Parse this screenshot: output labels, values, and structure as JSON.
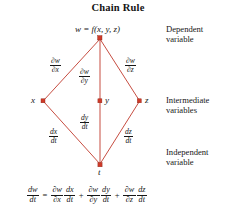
{
  "title": "Chain Rule",
  "colors": {
    "edge": "#c0392b",
    "node": "#cf3a28",
    "text": "#171717",
    "background": "#ffffff"
  },
  "diagram": {
    "type": "tree-diagram",
    "nodes": [
      {
        "id": "w",
        "label": "w = f(x, y, z)",
        "x": 100,
        "y": 38,
        "role": "dependent"
      },
      {
        "id": "x",
        "label": "x",
        "x": 43,
        "y": 101,
        "role": "intermediate"
      },
      {
        "id": "y",
        "label": "y",
        "x": 100,
        "y": 101,
        "role": "intermediate"
      },
      {
        "id": "z",
        "label": "z",
        "x": 140,
        "y": 101,
        "role": "intermediate"
      },
      {
        "id": "t",
        "label": "t",
        "x": 100,
        "y": 165,
        "role": "independent"
      }
    ],
    "edges": [
      {
        "from": "w",
        "to": "x",
        "num": "∂w",
        "den": "∂x"
      },
      {
        "from": "w",
        "to": "y",
        "num": "∂w",
        "den": "∂y"
      },
      {
        "from": "w",
        "to": "z",
        "num": "∂w",
        "den": "∂z"
      },
      {
        "from": "x",
        "to": "t",
        "num": "dx",
        "den": "dt"
      },
      {
        "from": "y",
        "to": "t",
        "num": "dy",
        "den": "dt"
      },
      {
        "from": "z",
        "to": "t",
        "num": "dz",
        "den": "dt"
      }
    ]
  },
  "annotations": {
    "dependent_line1": "Dependent",
    "dependent_line2": "variable",
    "intermediate_line1": "Intermediate",
    "intermediate_line2": "variables",
    "independent_line1": "Independent",
    "independent_line2": "variable"
  },
  "equation": {
    "lhs": {
      "num": "dw",
      "den": "dt"
    },
    "equals": "=",
    "plus": "+",
    "terms": [
      {
        "a_num": "∂w",
        "a_den": "∂x",
        "b_num": "dx",
        "b_den": "dt"
      },
      {
        "a_num": "∂w",
        "a_den": "∂y",
        "b_num": "dy",
        "b_den": "dt"
      },
      {
        "a_num": "∂w",
        "a_den": "∂z",
        "b_num": "dz",
        "b_den": "dt"
      }
    ]
  }
}
